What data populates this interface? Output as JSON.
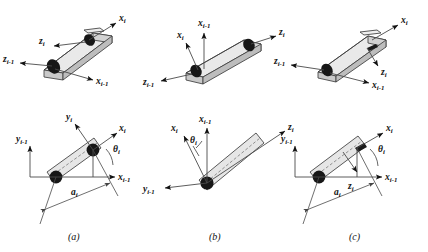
{
  "figure": {
    "background_color": "#ffffff",
    "link_fill": "#e9e9e9",
    "link_top_fill": "#d2d2d2",
    "link_side_fill": "#bdbdbd",
    "stroke_color": "#3d3d3d",
    "joint_color": "#171717",
    "width": 428,
    "height": 252
  },
  "captions": {
    "a": "(a)",
    "b": "(b)",
    "c": "(c)"
  },
  "symbols": {
    "x": "x",
    "y": "y",
    "z": "z",
    "theta": "θ",
    "a": "a",
    "i": "i",
    "i_minus_1": "i-1"
  },
  "panels": [
    {
      "id": "panel-a-top",
      "view": "3d",
      "column": "a",
      "row": "top",
      "description": "Link prism tilted down-left with joint axes at both ends",
      "labels": [
        {
          "name": "x-i",
          "base": "x",
          "sub": "i"
        },
        {
          "name": "z-i",
          "base": "z",
          "sub": "i"
        },
        {
          "name": "z-i-1",
          "base": "z",
          "sub": "i-1"
        },
        {
          "name": "x-i-1",
          "base": "x",
          "sub": "i-1"
        }
      ]
    },
    {
      "id": "panel-b-top",
      "view": "3d",
      "column": "b",
      "row": "top",
      "description": "Link prism tilted up-right with joint axes at both ends",
      "labels": [
        {
          "name": "x-i",
          "base": "x",
          "sub": "i"
        },
        {
          "name": "x-i-1",
          "base": "x",
          "sub": "i-1"
        },
        {
          "name": "z-i",
          "base": "z",
          "sub": "i"
        },
        {
          "name": "z-i-1",
          "base": "z",
          "sub": "i-1"
        }
      ]
    },
    {
      "id": "panel-c-top",
      "view": "3d",
      "column": "c",
      "row": "top",
      "description": "Link prism tilted up-right with z-i pointing down-right",
      "labels": [
        {
          "name": "x-i",
          "base": "x",
          "sub": "i"
        },
        {
          "name": "z-i",
          "base": "z",
          "sub": "i"
        },
        {
          "name": "z-i-1",
          "base": "z",
          "sub": "i-1"
        },
        {
          "name": "x-i-1",
          "base": "x",
          "sub": "i-1"
        }
      ]
    },
    {
      "id": "panel-a-bottom",
      "view": "2d",
      "column": "a",
      "row": "bottom",
      "description": "Planar projection with theta-i joint angle and a-i link length",
      "labels": [
        {
          "name": "y-i-1",
          "base": "y",
          "sub": "i-1"
        },
        {
          "name": "y-i",
          "base": "y",
          "sub": "i"
        },
        {
          "name": "x-i",
          "base": "x",
          "sub": "i"
        },
        {
          "name": "theta-i",
          "base": "θ",
          "sub": "i"
        },
        {
          "name": "x-i-1",
          "base": "x",
          "sub": "i-1"
        },
        {
          "name": "a-i",
          "base": "a",
          "sub": "i"
        }
      ]
    },
    {
      "id": "panel-b-bottom",
      "view": "2d",
      "column": "b",
      "row": "bottom",
      "description": "Planar projection with theta-i at origin and z-i along link",
      "labels": [
        {
          "name": "x-i-1",
          "base": "x",
          "sub": "i-1"
        },
        {
          "name": "x-i",
          "base": "x",
          "sub": "i"
        },
        {
          "name": "theta-i",
          "base": "θ",
          "sub": "i"
        },
        {
          "name": "z-i",
          "base": "z",
          "sub": "i"
        },
        {
          "name": "y-i-1",
          "base": "y",
          "sub": "i-1"
        }
      ]
    },
    {
      "id": "panel-c-bottom",
      "view": "2d",
      "column": "c",
      "row": "bottom",
      "description": "Planar projection with theta-i, z-i into page and a-i link length",
      "labels": [
        {
          "name": "y-i-1",
          "base": "y",
          "sub": "i-1"
        },
        {
          "name": "x-i",
          "base": "x",
          "sub": "i"
        },
        {
          "name": "theta-i",
          "base": "θ",
          "sub": "i"
        },
        {
          "name": "x-i-1",
          "base": "x",
          "sub": "i-1"
        },
        {
          "name": "z-i",
          "base": "z",
          "sub": "i"
        },
        {
          "name": "a-i",
          "base": "a",
          "sub": "i"
        }
      ]
    }
  ]
}
